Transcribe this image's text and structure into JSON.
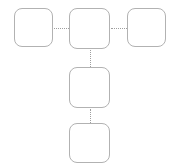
{
  "canvas": {
    "width": 179,
    "height": 165,
    "background": "#ffffff",
    "node_border_color": "#b2b2b2",
    "connector_color": "#9e9e9e"
  },
  "diagram": {
    "type": "flow-diagram",
    "orientation": "t-shape",
    "nodes": [
      {
        "id": "node-1",
        "label": "",
        "x": 14,
        "y": 8,
        "width": 39,
        "height": 39
      },
      {
        "id": "node-2",
        "label": "",
        "x": 69,
        "y": 8,
        "width": 41,
        "height": 41
      },
      {
        "id": "node-3",
        "label": "",
        "x": 127,
        "y": 8,
        "width": 39,
        "height": 39
      },
      {
        "id": "node-4",
        "label": "",
        "x": 69,
        "y": 67,
        "width": 41,
        "height": 41
      },
      {
        "id": "node-5",
        "label": "",
        "x": 69,
        "y": 123,
        "width": 41,
        "height": 40
      }
    ],
    "connectors": [
      {
        "id": "connector-1-2",
        "from": "node-1",
        "to": "node-2",
        "style": "dotted",
        "direction": "horizontal",
        "x": 54,
        "y": 28,
        "length": 15
      },
      {
        "id": "connector-2-3",
        "from": "node-2",
        "to": "node-3",
        "style": "dotted",
        "direction": "horizontal",
        "x": 111,
        "y": 28,
        "length": 16
      },
      {
        "id": "connector-2-4",
        "from": "node-2",
        "to": "node-4",
        "style": "dotted",
        "direction": "vertical",
        "x": 90,
        "y": 50,
        "length": 17
      },
      {
        "id": "connector-4-5",
        "from": "node-4",
        "to": "node-5",
        "style": "dotted",
        "direction": "vertical",
        "x": 90,
        "y": 109,
        "length": 14
      }
    ]
  }
}
